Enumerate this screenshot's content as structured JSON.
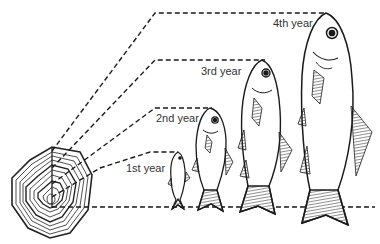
{
  "labels": {
    "year1": "1st year",
    "year2": "2nd year",
    "year3": "3rd year",
    "year4": "4th year"
  },
  "colors": {
    "ink": "#1a1a1a",
    "background": "#ffffff"
  },
  "elements": {
    "scale": "fish-scale-with-growth-rings",
    "fish_count": 4
  }
}
